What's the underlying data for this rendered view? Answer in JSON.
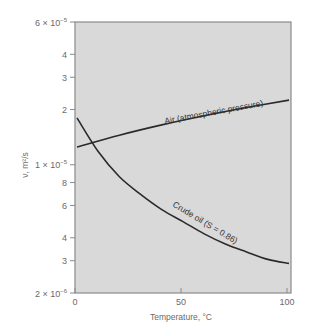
{
  "chart_data": {
    "type": "line",
    "title": "",
    "xlabel": "Temperature, °C",
    "ylabel": "ν, m²/s",
    "xlim": [
      0,
      100
    ],
    "ylim": [
      2e-06,
      6e-05
    ],
    "yscale": "log",
    "grid": false,
    "x_ticks": [
      {
        "value": 0,
        "label": "0"
      },
      {
        "value": 50,
        "label": "50"
      },
      {
        "value": 100,
        "label": "100"
      }
    ],
    "y_ticks": [
      {
        "value": 6e-05,
        "mantissa": "6 × 10",
        "exp": "−5"
      },
      {
        "value": 4e-05,
        "mantissa": "4",
        "exp": ""
      },
      {
        "value": 3e-05,
        "mantissa": "3",
        "exp": ""
      },
      {
        "value": 2e-05,
        "mantissa": "2",
        "exp": ""
      },
      {
        "value": 1e-05,
        "mantissa": "1 × 10",
        "exp": "−5"
      },
      {
        "value": 8e-06,
        "mantissa": "8",
        "exp": ""
      },
      {
        "value": 6e-06,
        "mantissa": "6",
        "exp": ""
      },
      {
        "value": 4e-06,
        "mantissa": "4",
        "exp": ""
      },
      {
        "value": 3e-06,
        "mantissa": "3",
        "exp": ""
      },
      {
        "value": 2e-06,
        "mantissa": "2 × 10",
        "exp": "−6"
      }
    ],
    "series": [
      {
        "name": "Air (atmospheric pressure)",
        "label": "Air (atmospheric pressure)",
        "x": [
          0,
          20,
          40,
          60,
          80,
          100
        ],
        "values": [
          1.25e-05,
          1.45e-05,
          1.65e-05,
          1.85e-05,
          2.05e-05,
          2.25e-05
        ]
      },
      {
        "name": "Crude oil (S = 0.86)",
        "label": "Crude oil (S = 0.86)",
        "x": [
          0,
          10,
          20,
          30,
          40,
          50,
          60,
          70,
          80,
          90,
          100
        ],
        "values": [
          1.8e-05,
          1.18e-05,
          8.6e-06,
          6.9e-06,
          5.7e-06,
          4.9e-06,
          4.2e-06,
          3.7e-06,
          3.35e-06,
          3.05e-06,
          2.9e-06
        ]
      }
    ]
  },
  "colors": {
    "plot_background": "#d9d9d9",
    "axis": "#8a8a8a",
    "curve": "#2a2a2a",
    "text": "#6a6a6a"
  }
}
